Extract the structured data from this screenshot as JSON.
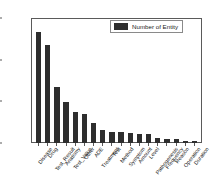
{
  "chart_data": {
    "type": "bar",
    "title": "",
    "subtitle": "",
    "xlabel": "",
    "ylabel": "",
    "grid": false,
    "legend_position": "top-right",
    "ylim": [
      0,
      30000
    ],
    "yticks": [
      0,
      10000,
      20000,
      30000
    ],
    "ytick_labels": [
      "0",
      "10000",
      "20000",
      "30000"
    ],
    "bar_color": "#2e2e2e",
    "categories": [
      "Disease",
      "Drug",
      "Test_Result",
      "Anatomy",
      "Test_Value",
      "Other",
      "ADE",
      "Treatment",
      "Test",
      "Method",
      "Symptom",
      "Amount",
      "Level",
      "Pathogenesis",
      "Frequency",
      "Reason",
      "Operation",
      "Duration"
    ],
    "series": [
      {
        "name": "Number of Entity",
        "values": [
          26600,
          23600,
          13400,
          9800,
          7500,
          6900,
          4800,
          3100,
          2600,
          2600,
          2300,
          2200,
          2100,
          1100,
          1000,
          900,
          600,
          600
        ]
      }
    ]
  },
  "legend": {
    "entries": [
      {
        "label": "Number of Entity",
        "color": "#2e2e2e"
      }
    ]
  }
}
